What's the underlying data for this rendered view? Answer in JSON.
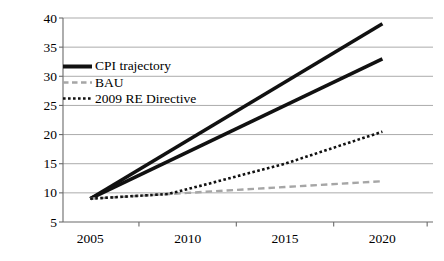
{
  "chart_data": {
    "type": "line",
    "title": "",
    "xlabel": "",
    "ylabel": "",
    "x_axis": {
      "tick_labels": [
        "2005",
        "2010",
        "2015",
        "2020"
      ],
      "label_years": [
        2005,
        2010,
        2015,
        2020
      ],
      "boundary_tick_years": [
        2007.5,
        2012.5,
        2017.5,
        2022.3
      ],
      "range": [
        2003.6,
        2022.6
      ]
    },
    "y_axis": {
      "tick_values": [
        5,
        10,
        15,
        20,
        25,
        30,
        35,
        40
      ],
      "range": [
        5,
        40
      ]
    },
    "grid": {
      "show": true,
      "color": "#ababab"
    },
    "axis_color": "#6b6b6b",
    "series": [
      {
        "name": "CPI trajectory (upper)",
        "legend_group": "CPI trajectory",
        "style": "solid",
        "color": "#111111",
        "points": [
          [
            2005,
            9
          ],
          [
            2020,
            39
          ]
        ]
      },
      {
        "name": "CPI trajectory (lower)",
        "legend_group": "CPI trajectory",
        "style": "solid",
        "color": "#111111",
        "points": [
          [
            2005,
            9
          ],
          [
            2020,
            33
          ]
        ]
      },
      {
        "name": "BAU",
        "legend_group": "BAU",
        "style": "dashed",
        "color": "#a6a6a6",
        "points": [
          [
            2005,
            9
          ],
          [
            2010,
            10
          ],
          [
            2015,
            11
          ],
          [
            2020,
            12
          ]
        ]
      },
      {
        "name": "2009 RE Directive",
        "legend_group": "2009 RE Directive",
        "style": "dotted",
        "color": "#111111",
        "points": [
          [
            2005,
            9
          ],
          [
            2009,
            9.8
          ],
          [
            2011,
            11.5
          ],
          [
            2015,
            15
          ],
          [
            2020,
            20.5
          ]
        ]
      }
    ],
    "legend": {
      "position": "inside-top-left",
      "items": [
        {
          "label": "CPI trajectory",
          "style": "solid",
          "color": "#111111"
        },
        {
          "label": "BAU",
          "style": "dashed",
          "color": "#a6a6a6"
        },
        {
          "label": "2009 RE Directive",
          "style": "dotted",
          "color": "#111111"
        }
      ]
    }
  }
}
